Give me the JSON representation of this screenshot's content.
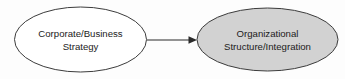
{
  "diagram": {
    "type": "flow-diagram",
    "background_color": "#fdfdfd",
    "nodes": [
      {
        "id": "corporate-business-strategy",
        "shape": "ellipse",
        "fill_color": "#ffffff",
        "stroke_color": "#3c3c3c",
        "cx": 80.5,
        "cy": 39.5,
        "rx": 66,
        "ry": 32.5,
        "lines": [
          "Corporate/Business",
          "Strategy"
        ]
      },
      {
        "id": "organizational-structure-integration",
        "shape": "ellipse",
        "fill_color": "#d2d2d2",
        "stroke_color": "#3c3c3c",
        "cx": 267.5,
        "cy": 39.5,
        "rx": 70.5,
        "ry": 31.5,
        "lines": [
          "Organizational",
          "Structure/Integration"
        ]
      }
    ],
    "connectors": [
      {
        "id": "strategy-to-structure-arrow",
        "from": "corporate-business-strategy",
        "to": "organizational-structure-integration",
        "direction": "left-to-right",
        "color": "#2b2b2b",
        "x1": 147,
        "y1": 40,
        "x2": 197,
        "y2": 40,
        "arrowhead": "solid-triangle"
      }
    ]
  }
}
